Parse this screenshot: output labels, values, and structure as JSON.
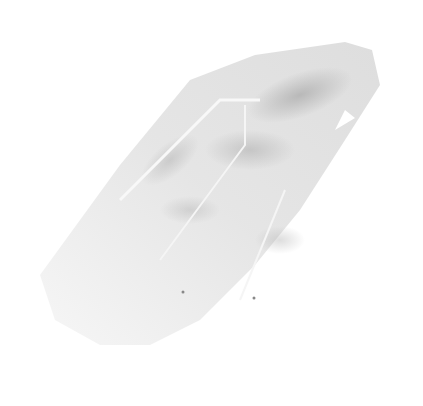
{
  "image": {
    "subject": "quartz crystal",
    "background_color": "#ffffff",
    "colors": {
      "light": "#f2f2f2",
      "mid": "#d8d8d8",
      "dark": "#b8b8b8"
    }
  }
}
